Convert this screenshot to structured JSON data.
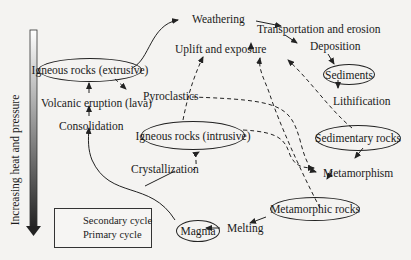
{
  "axis": {
    "label": "Increasing heat and pressure"
  },
  "nodes": {
    "igneous_extrusive": "Igneous rocks (extrusive)",
    "volcanic_eruption": "Volcanic eruption (lava)",
    "consolidation": "Consolidation",
    "weathering": "Weathering",
    "transportation": "Transportation and erosion",
    "deposition": "Deposition",
    "sediments": "Sediments",
    "lithification": "Lithification",
    "sedimentary": "Sedimentary rocks",
    "uplift": "Uplift and exposure",
    "pyroclastics": "Pyroclastics",
    "igneous_intrusive": "Igneous rocks (intrusive)",
    "crystallization": "Crystallization",
    "metamorphism": "Metamorphism",
    "metamorphic": "Metamorphic rocks",
    "magma": "Magma",
    "melting": "Melting"
  },
  "legend": {
    "secondary": "Secondary cycle",
    "primary": "Primary cycle"
  },
  "colors": {
    "ink": "#222222",
    "background": "#f4f3f1"
  }
}
